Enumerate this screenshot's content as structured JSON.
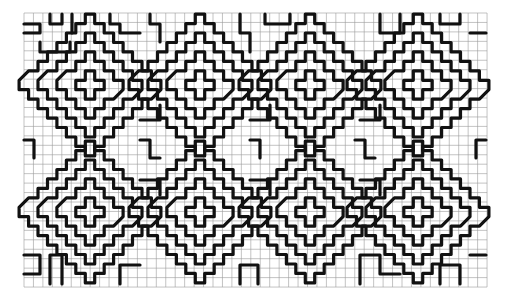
{
  "figure": {
    "background": "#ffffff",
    "ink_color": "#111111",
    "grid_color": "#9a9a9a"
  },
  "grid": {
    "x0": 24,
    "y0": 13,
    "cell": 9.45,
    "cols": 49,
    "rows": 29
  },
  "motifs": {
    "type": "concentric-stepped-diamond",
    "ring_radii": [
      1,
      3,
      5,
      7
    ],
    "centers": [
      {
        "x": 90,
        "y": 85
      },
      {
        "x": 200,
        "y": 85
      },
      {
        "x": 310,
        "y": 85
      },
      {
        "x": 418,
        "y": 85
      },
      {
        "x": 90,
        "y": 212
      },
      {
        "x": 200,
        "y": 212
      },
      {
        "x": 310,
        "y": 212
      },
      {
        "x": 418,
        "y": 212
      }
    ]
  },
  "fillers": {
    "type": "maze-bars",
    "paths": [
      [
        [
          24,
          24
        ],
        [
          40,
          24
        ],
        [
          40,
          33
        ],
        [
          24,
          33
        ]
      ],
      [
        [
          50,
          14
        ],
        [
          50,
          24
        ],
        [
          62,
          24
        ],
        [
          62,
          14
        ]
      ],
      [
        [
          72,
          14
        ],
        [
          72,
          33
        ]
      ],
      [
        [
          40,
          42
        ],
        [
          40,
          52
        ],
        [
          70,
          52
        ],
        [
          70,
          42
        ]
      ],
      [
        [
          110,
          14
        ],
        [
          110,
          24
        ],
        [
          120,
          24
        ],
        [
          120,
          33
        ],
        [
          140,
          33
        ]
      ],
      [
        [
          150,
          14
        ],
        [
          150,
          24
        ],
        [
          160,
          24
        ],
        [
          160,
          42
        ]
      ],
      [
        [
          240,
          14
        ],
        [
          240,
          33
        ],
        [
          250,
          33
        ],
        [
          250,
          52
        ]
      ],
      [
        [
          265,
          14
        ],
        [
          265,
          24
        ],
        [
          290,
          24
        ],
        [
          290,
          14
        ]
      ],
      [
        [
          380,
          14
        ],
        [
          380,
          33
        ],
        [
          400,
          33
        ],
        [
          400,
          14
        ]
      ],
      [
        [
          440,
          14
        ],
        [
          440,
          24
        ],
        [
          460,
          24
        ],
        [
          460,
          14
        ]
      ],
      [
        [
          470,
          33
        ],
        [
          486,
          33
        ]
      ],
      [
        [
          24,
          140
        ],
        [
          34,
          140
        ],
        [
          34,
          158
        ]
      ],
      [
        [
          486,
          140
        ],
        [
          476,
          140
        ],
        [
          476,
          158
        ]
      ],
      [
        [
          140,
          140
        ],
        [
          150,
          140
        ],
        [
          150,
          158
        ],
        [
          160,
          158
        ]
      ],
      [
        [
          250,
          140
        ],
        [
          260,
          140
        ],
        [
          260,
          158
        ]
      ],
      [
        [
          355,
          140
        ],
        [
          365,
          140
        ],
        [
          365,
          158
        ],
        [
          375,
          158
        ]
      ],
      [
        [
          24,
          255
        ],
        [
          40,
          255
        ],
        [
          40,
          274
        ],
        [
          24,
          274
        ]
      ],
      [
        [
          50,
          284
        ],
        [
          50,
          255
        ],
        [
          62,
          255
        ],
        [
          62,
          284
        ]
      ],
      [
        [
          120,
          284
        ],
        [
          120,
          265
        ],
        [
          140,
          265
        ]
      ],
      [
        [
          240,
          284
        ],
        [
          240,
          265
        ],
        [
          258,
          265
        ],
        [
          258,
          284
        ]
      ],
      [
        [
          360,
          284
        ],
        [
          360,
          255
        ],
        [
          380,
          255
        ],
        [
          380,
          274
        ],
        [
          400,
          274
        ]
      ],
      [
        [
          440,
          284
        ],
        [
          440,
          265
        ],
        [
          460,
          265
        ],
        [
          460,
          284
        ]
      ],
      [
        [
          470,
          255
        ],
        [
          486,
          255
        ]
      ],
      [
        [
          140,
          120
        ],
        [
          160,
          120
        ],
        [
          160,
          105
        ]
      ],
      [
        [
          250,
          120
        ],
        [
          270,
          120
        ],
        [
          270,
          105
        ]
      ],
      [
        [
          360,
          120
        ],
        [
          380,
          120
        ],
        [
          380,
          105
        ]
      ],
      [
        [
          140,
          180
        ],
        [
          160,
          180
        ],
        [
          160,
          195
        ]
      ],
      [
        [
          250,
          180
        ],
        [
          270,
          180
        ],
        [
          270,
          195
        ]
      ],
      [
        [
          360,
          180
        ],
        [
          380,
          180
        ],
        [
          380,
          195
        ]
      ]
    ]
  }
}
